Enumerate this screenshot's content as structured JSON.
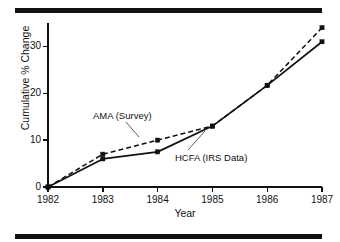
{
  "figure": {
    "name": "cumulative-percent-change-line-chart",
    "background_color": "#ffffff",
    "ink_color": "#111111",
    "top_rule_present": true,
    "bottom_rule_present": true
  },
  "axes": {
    "y_title": "Cumulative % Change",
    "x_title": "Year",
    "y_ticks": [
      "0",
      "10",
      "20",
      "30"
    ],
    "x_ticks": [
      "1982",
      "1983",
      "1984",
      "1985",
      "1986",
      "1987"
    ]
  },
  "annotations": {
    "ama_label": "AMA (Survey)",
    "hcfa_label": "HCFA (IRS Data)"
  },
  "chart_data": {
    "type": "line",
    "title": "",
    "subtitle": "",
    "xlabel": "Year",
    "ylabel": "Cumulative % Change",
    "x": [
      1982,
      1983,
      1984,
      1985,
      1986,
      1987
    ],
    "categories": [
      "1982",
      "1983",
      "1984",
      "1985",
      "1986",
      "1987"
    ],
    "xlim": [
      1982,
      1987
    ],
    "ylim": [
      0,
      35
    ],
    "yticks": [
      0,
      10,
      20,
      30
    ],
    "xticks": [
      1982,
      1983,
      1984,
      1985,
      1986,
      1987
    ],
    "grid": false,
    "legend": "inline-annotations",
    "legend_position": "inside-plot",
    "series": [
      {
        "name": "AMA (Survey)",
        "line_style": "dashed",
        "marker": "square",
        "color": "#111111",
        "values": [
          0,
          7,
          10,
          13,
          21.7,
          34
        ]
      },
      {
        "name": "HCFA (IRS Data)",
        "line_style": "solid",
        "marker": "square",
        "color": "#111111",
        "values": [
          0,
          6,
          7.5,
          13,
          21.7,
          31
        ]
      }
    ]
  }
}
